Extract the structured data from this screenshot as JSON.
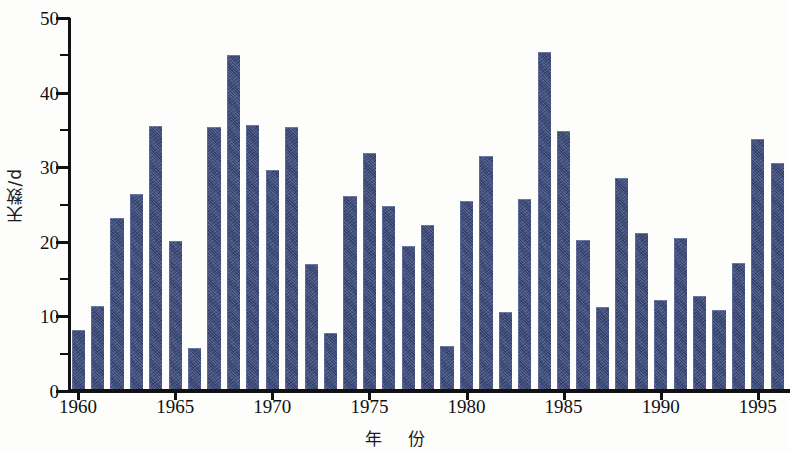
{
  "chart_data": {
    "type": "bar",
    "title": "",
    "xlabel": "年  份",
    "ylabel": "天数/d",
    "ylim": [
      0,
      50
    ],
    "xlim": [
      1959.5,
      1996.5
    ],
    "grid": false,
    "legend": null,
    "y_major_ticks": [
      0,
      10,
      20,
      30,
      40,
      50
    ],
    "y_minor_ticks": [
      5,
      15,
      25,
      35,
      45
    ],
    "x_tick_labels": [
      "1960",
      "1965",
      "1970",
      "1975",
      "1980",
      "1985",
      "1990",
      "1995"
    ],
    "x_tick_values": [
      1960,
      1965,
      1970,
      1975,
      1980,
      1985,
      1990,
      1995
    ],
    "bar_color": "#3b4a7c",
    "axis_color": "#111111",
    "background_color": "#fdfdfb",
    "categories": [
      "1960",
      "1961",
      "1962",
      "1963",
      "1964",
      "1965",
      "1966",
      "1967",
      "1968",
      "1969",
      "1970",
      "1971",
      "1972",
      "1973",
      "1974",
      "1975",
      "1976",
      "1977",
      "1978",
      "1979",
      "1980",
      "1981",
      "1982",
      "1983",
      "1984",
      "1985",
      "1986",
      "1987",
      "1988",
      "1989",
      "1990",
      "1991",
      "1992",
      "1993",
      "1994",
      "1995",
      "1996"
    ],
    "values": [
      8.2,
      11.4,
      23.2,
      26.4,
      35.5,
      20.1,
      5.7,
      35.4,
      45.0,
      35.7,
      29.6,
      35.4,
      17.0,
      7.8,
      26.2,
      31.9,
      24.8,
      19.4,
      22.2,
      6.0,
      25.5,
      31.5,
      10.6,
      25.8,
      45.5,
      34.8,
      20.2,
      11.3,
      28.5,
      21.2,
      12.2,
      20.5,
      12.7,
      10.8,
      17.1,
      33.8,
      30.5
    ]
  },
  "axes": {
    "y_label_text": "天数/d",
    "x_label_first": "年",
    "x_label_second": "份"
  }
}
